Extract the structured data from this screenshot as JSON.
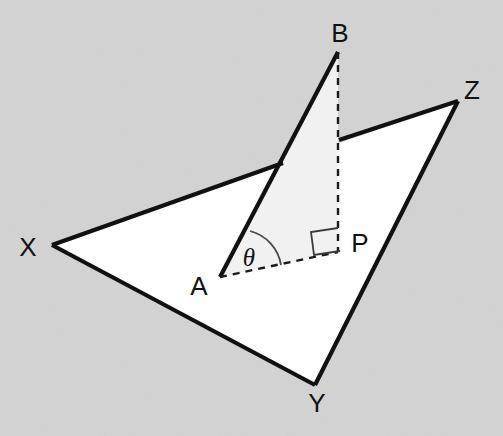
{
  "diagram": {
    "kind": "3d-geometry-dihedral-angle",
    "background_color": "#d8d8d8",
    "plane_fill_color": "#ffffff",
    "vertical_triangle_fill_color": "#f1f1f1",
    "line_color": "#111111",
    "labels": {
      "b": "B",
      "z": "Z",
      "x": "X",
      "y": "Y",
      "a": "A",
      "p": "P",
      "theta": "θ"
    },
    "points": {
      "B": {
        "x": 338,
        "y": 52
      },
      "Z": {
        "x": 458,
        "y": 101
      },
      "X": {
        "x": 52,
        "y": 245
      },
      "Y": {
        "x": 315,
        "y": 385
      },
      "A": {
        "x": 220,
        "y": 277
      },
      "P": {
        "x": 338,
        "y": 252
      }
    },
    "label_positions": {
      "B": {
        "x": 340,
        "y": 42
      },
      "Z": {
        "x": 468,
        "y": 99
      },
      "X": {
        "x": 22,
        "y": 256
      },
      "Y": {
        "x": 306,
        "y": 412
      },
      "A": {
        "x": 190,
        "y": 295
      },
      "P": {
        "x": 352,
        "y": 252
      },
      "theta": {
        "x": 239,
        "y": 266
      }
    },
    "elements": {
      "base_plane": "triangle XYZ",
      "vertical_triangle": "triangle ABP",
      "altitude": "BP (dashed, perpendicular to plane)",
      "projection": "AP (dashed, in plane)",
      "slant": "AB (solid)",
      "angle_marked": "theta at A between AB and AP",
      "right_angle_at": "P"
    }
  }
}
